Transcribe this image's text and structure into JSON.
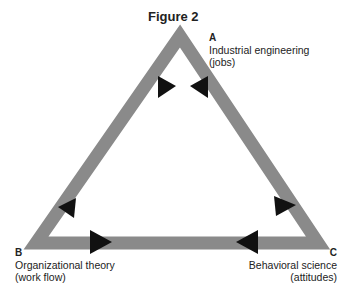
{
  "figure": {
    "title": "Figure 2"
  },
  "vertices": {
    "A": {
      "letter": "A",
      "name": "Industrial engineering",
      "detail": "(jobs)"
    },
    "B": {
      "letter": "B",
      "name": "Organizational theory",
      "detail": "(work flow)"
    },
    "C": {
      "letter": "C",
      "name": "Behavioral science",
      "detail": "(attitudes)"
    }
  },
  "colors": {
    "edge": "#8a8a8a",
    "arrow": "#111111"
  }
}
